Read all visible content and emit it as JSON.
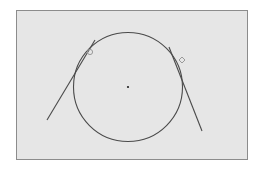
{
  "diagram": {
    "title": "",
    "colors": {
      "page_background": "#ffffff",
      "panel_background": "#e6e6e6",
      "panel_border": "#8c8c8c",
      "stroke": "#4a4a4a",
      "marker": "#9a9a9a",
      "center_dot": "#222222"
    },
    "elements": [
      {
        "type": "circle",
        "name": "main-circle"
      },
      {
        "type": "point",
        "name": "circle-center"
      },
      {
        "type": "line",
        "name": "tangent-line-left"
      },
      {
        "type": "line",
        "name": "tangent-line-right"
      },
      {
        "type": "marker",
        "name": "tangent-point-marker-left",
        "shape": "small-circle"
      },
      {
        "type": "marker",
        "name": "tangent-point-marker-right",
        "shape": "small-diamond"
      }
    ]
  }
}
